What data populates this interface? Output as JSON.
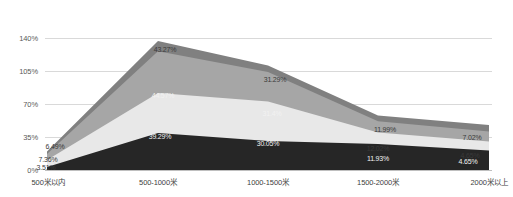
{
  "chart_data": {
    "type": "area",
    "stacked": true,
    "title": "",
    "subtitle": "",
    "xlabel": "",
    "ylabel": "",
    "ylim": [
      0,
      140
    ],
    "grid": true,
    "legend_position": "none",
    "categories": [
      "500米以内",
      "500-1000米",
      "1000-1500米",
      "1500-2000米",
      "2000米以上"
    ],
    "ytick_labels": [
      "0%",
      "35%",
      "70%",
      "105%",
      "140%"
    ],
    "ytick_values": [
      0,
      35,
      70,
      105,
      140
    ],
    "series": [
      {
        "name": "series-1",
        "color": "#262626",
        "values": [
          3.51,
          39.29,
          30.05,
          11.93,
          4.65
        ],
        "labels": [
          "3.51%",
          "39.29%",
          "30.05%",
          "11.93%",
          "4.65%"
        ]
      },
      {
        "name": "series-2",
        "color": "#e8e8e8",
        "values": [
          7.36,
          31.4,
          31.4,
          12.02,
          4.65
        ],
        "labels": [
          "7.36%",
          "",
          "31.4%",
          "12.02%",
          ""
        ]
      },
      {
        "name": "series-3",
        "color": "#a6a6a6",
        "values": [
          6.49,
          44.57,
          31.29,
          11.99,
          7.02
        ],
        "labels": [
          "6.49%",
          "44.57%",
          "31.29%",
          "11.99%",
          "7.02%"
        ]
      },
      {
        "name": "series-4",
        "color": "#808080",
        "values": [
          6.49,
          43.27,
          31.29,
          11.99,
          7.02
        ],
        "labels": [
          "",
          "43.27%",
          "",
          "",
          ""
        ]
      }
    ],
    "point_labels": [
      {
        "text": "43.27%",
        "x": 165,
        "y": 46,
        "tone": "dark"
      },
      {
        "text": "31.29%",
        "x": 275,
        "y": 76,
        "tone": "dark"
      },
      {
        "text": "11.99%",
        "x": 385,
        "y": 126,
        "tone": "dark"
      },
      {
        "text": "7.02%",
        "x": 472,
        "y": 134,
        "tone": "dark"
      },
      {
        "text": "44.57%",
        "x": 163,
        "y": 92,
        "tone": "light"
      },
      {
        "text": "31.4%",
        "x": 272,
        "y": 110,
        "tone": "light"
      },
      {
        "text": "12.02%",
        "x": 378,
        "y": 145,
        "tone": "dark"
      },
      {
        "text": "4.65%",
        "x": 470,
        "y": 152,
        "tone": "dark"
      },
      {
        "text": "39.29%",
        "x": 160,
        "y": 133,
        "tone": "light"
      },
      {
        "text": "30.05%",
        "x": 268,
        "y": 140,
        "tone": "light"
      },
      {
        "text": "11.93%",
        "x": 378,
        "y": 155,
        "tone": "light"
      },
      {
        "text": "4.65%",
        "x": 468,
        "y": 158,
        "tone": "light"
      },
      {
        "text": "6.49%",
        "x": 55,
        "y": 143,
        "tone": "dark"
      },
      {
        "text": "7.36%",
        "x": 48,
        "y": 156,
        "tone": "dark"
      },
      {
        "text": "3.51%",
        "x": 46,
        "y": 164,
        "tone": "dark"
      }
    ]
  }
}
